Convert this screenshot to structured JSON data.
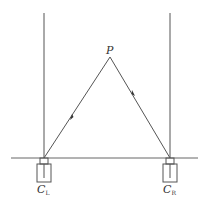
{
  "diagram": {
    "type": "stereo-camera-geometry",
    "colors": {
      "line": "#555555",
      "background": "#ffffff"
    },
    "point": {
      "label": "P"
    },
    "cameras": [
      {
        "id": "left",
        "label": "C",
        "subscript": "L"
      },
      {
        "id": "right",
        "label": "C",
        "subscript": "R"
      }
    ]
  }
}
